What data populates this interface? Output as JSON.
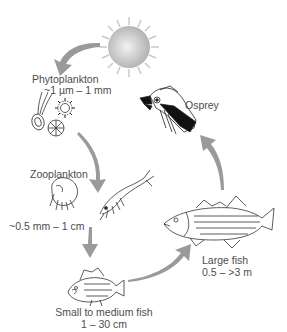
{
  "diagram": {
    "type": "food-chain",
    "colors": {
      "arrow": "#9a9a9a",
      "text": "#4d4d4d",
      "sun": "#c8c8c8",
      "line_art": "#333333"
    },
    "nodes": [
      {
        "id": "sun",
        "label": "",
        "icon": "sun-icon"
      },
      {
        "id": "phytoplankton",
        "label": "Phytoplankton",
        "size": "~1 µm – 1 mm",
        "icon": "phytoplankton-icon"
      },
      {
        "id": "zooplankton",
        "label": "Zooplankton",
        "size": "~0.5 mm – 1 cm",
        "icon": "zooplankton-icon"
      },
      {
        "id": "small_fish",
        "label": "Small to medium fish",
        "size": "1 – 30 cm",
        "icon": "small-fish-icon"
      },
      {
        "id": "large_fish",
        "label": "Large fish",
        "size": "0.5 – >3 m",
        "icon": "large-fish-icon"
      },
      {
        "id": "osprey",
        "label": "Osprey",
        "icon": "osprey-icon"
      }
    ],
    "edges": [
      {
        "from": "sun",
        "to": "phytoplankton"
      },
      {
        "from": "phytoplankton",
        "to": "zooplankton"
      },
      {
        "from": "zooplankton",
        "to": "small_fish"
      },
      {
        "from": "small_fish",
        "to": "large_fish"
      },
      {
        "from": "large_fish",
        "to": "osprey"
      }
    ]
  }
}
